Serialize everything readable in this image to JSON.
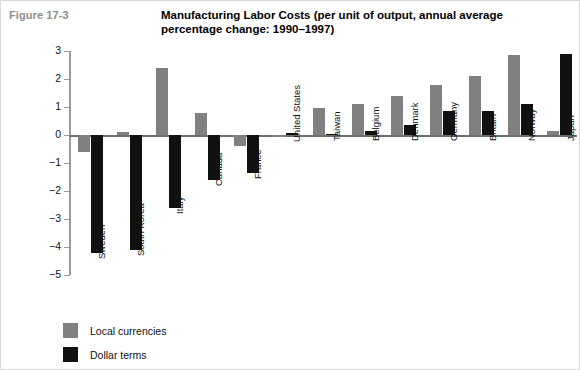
{
  "figure_label": "Figure 17-3",
  "title": "Manufacturing Labor Costs (per unit of output, annual average percentage change: 1990–1997)",
  "legend": {
    "items": [
      {
        "label": "Local currencies",
        "color": "#808080",
        "key": "local"
      },
      {
        "label": "Dollar terms",
        "color": "#111111",
        "key": "dollar"
      }
    ]
  },
  "colors": {
    "local_currencies": "#808080",
    "dollar_terms": "#111111",
    "axis": "#9a9a9a",
    "figure_label": "#8c8c8c",
    "border": "#d8d8d8"
  },
  "chart_data": {
    "type": "bar",
    "title": "Manufacturing Labor Costs (per unit of output, annual average percentage change: 1990–1997)",
    "xlabel": "",
    "ylabel": "",
    "ylim": [
      -5,
      3
    ],
    "yticks": [
      3,
      2,
      1,
      0,
      -1,
      -2,
      -3,
      -4,
      -5
    ],
    "ytick_labels": [
      "3",
      "2",
      "1",
      "0",
      "−1",
      "−2",
      "−3",
      "−4",
      "−5"
    ],
    "grid": false,
    "legend_position": "bottom-left",
    "orientation": "vertical-grouped",
    "categories": [
      "Sweden",
      "South Korea",
      "Italy",
      "Canada",
      "France",
      "United States",
      "Taiwan",
      "Belgium",
      "Denmark",
      "Germany",
      "Britain",
      "Norway",
      "Japan"
    ],
    "series": [
      {
        "name": "Local currencies",
        "color": "#808080",
        "values": [
          -0.6,
          0.1,
          2.4,
          0.8,
          -0.4,
          -0.05,
          0.95,
          1.1,
          1.4,
          1.8,
          2.1,
          2.85,
          0.15
        ]
      },
      {
        "name": "Dollar terms",
        "color": "#111111",
        "values": [
          -4.2,
          -4.1,
          -2.6,
          -1.6,
          -1.35,
          0.08,
          0.0,
          0.15,
          0.35,
          0.85,
          0.85,
          1.1,
          2.9
        ]
      }
    ]
  }
}
